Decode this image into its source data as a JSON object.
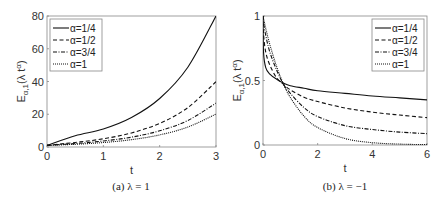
{
  "chart_data": [
    {
      "type": "line",
      "caption": "(a) λ = 1",
      "xlabel": "t",
      "ylabel": "E_{α,1}(λ t^α)",
      "xlim": [
        0,
        3
      ],
      "ylim": [
        0,
        80
      ],
      "xticks": [
        "0",
        "1",
        "2",
        "3"
      ],
      "yticks": [
        "0",
        "20",
        "40",
        "60",
        "80"
      ],
      "grid": false,
      "legend_position": "upper left",
      "x": [
        0,
        0.5,
        1,
        1.5,
        2,
        2.5,
        3
      ],
      "series": [
        {
          "name": "α=1/4",
          "style": "solid",
          "values": [
            1,
            6.9,
            11.0,
            18.0,
            29.6,
            48.7,
            80.0
          ]
        },
        {
          "name": "α=1/2",
          "style": "dashed",
          "values": [
            1,
            2.78,
            5.01,
            8.59,
            14.45,
            24.06,
            39.9
          ]
        },
        {
          "name": "α=3/4",
          "style": "dashdot",
          "values": [
            1,
            2.1,
            3.7,
            6.0,
            9.9,
            16.2,
            26.8
          ]
        },
        {
          "name": "α=1",
          "style": "dotted",
          "values": [
            1,
            1.65,
            2.72,
            4.48,
            7.39,
            12.18,
            20.09
          ]
        }
      ]
    },
    {
      "type": "line",
      "caption": "(b) λ = −1",
      "xlabel": "t",
      "ylabel": "E_{α,1}(λ t^α)",
      "xlim": [
        0,
        6
      ],
      "ylim": [
        0,
        1
      ],
      "xticks": [
        "0",
        "2",
        "4",
        "6"
      ],
      "yticks": [
        "0",
        "0.5",
        "1"
      ],
      "grid": false,
      "legend_position": "upper right",
      "x": [
        0,
        0.02,
        0.1,
        0.25,
        0.5,
        0.75,
        1,
        1.5,
        2,
        3,
        4,
        5,
        6
      ],
      "series": [
        {
          "name": "α=1/4",
          "style": "solid",
          "values": [
            1,
            0.72,
            0.6,
            0.55,
            0.51,
            0.48,
            0.46,
            0.44,
            0.42,
            0.4,
            0.38,
            0.365,
            0.35
          ]
        },
        {
          "name": "α=1/2",
          "style": "dashed",
          "values": [
            1,
            0.86,
            0.72,
            0.62,
            0.52,
            0.47,
            0.428,
            0.37,
            0.337,
            0.287,
            0.255,
            0.232,
            0.212
          ]
        },
        {
          "name": "α=3/4",
          "style": "dashdot",
          "values": [
            1,
            0.95,
            0.85,
            0.72,
            0.58,
            0.47,
            0.4,
            0.29,
            0.22,
            0.15,
            0.12,
            0.1,
            0.088
          ]
        },
        {
          "name": "α=1",
          "style": "dotted",
          "values": [
            1,
            0.98,
            0.905,
            0.779,
            0.607,
            0.472,
            0.368,
            0.223,
            0.135,
            0.05,
            0.018,
            0.007,
            0.0025
          ]
        }
      ]
    }
  ]
}
